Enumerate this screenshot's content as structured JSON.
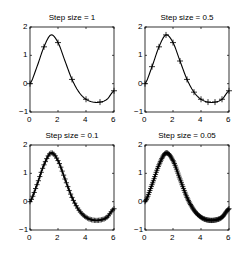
{
  "chart_data": [
    {
      "type": "line",
      "title": "Step size = 1",
      "xlabel": "",
      "ylabel": "",
      "xlim": [
        0,
        6
      ],
      "ylim": [
        -1,
        2
      ],
      "xticks": [
        "0",
        "2",
        "4",
        "6"
      ],
      "yticks": [
        "-1",
        "0",
        "1",
        "2"
      ],
      "grid": false,
      "marker": "+",
      "series": [
        {
          "name": "exact",
          "style": "line",
          "x": [
            0,
            0.5,
            1,
            1.5,
            2,
            2.5,
            3,
            3.5,
            4,
            4.5,
            5,
            5.5,
            6
          ],
          "y": [
            0,
            0.6,
            1.3,
            1.72,
            1.45,
            0.8,
            0.15,
            -0.3,
            -0.55,
            -0.65,
            -0.65,
            -0.55,
            -0.25
          ]
        },
        {
          "name": "approx",
          "style": "markers",
          "x": [
            0,
            1,
            2,
            3,
            4,
            5,
            6
          ],
          "y": [
            0,
            1.3,
            1.45,
            0.15,
            -0.55,
            -0.65,
            -0.25
          ]
        }
      ]
    },
    {
      "type": "line",
      "title": "Step size = 0.5",
      "xlim": [
        0,
        6
      ],
      "ylim": [
        -1,
        2
      ],
      "xticks": [
        "0",
        "2",
        "4",
        "6"
      ],
      "yticks": [
        "-1",
        "0",
        "1",
        "2"
      ],
      "marker": "+",
      "series": [
        {
          "name": "approx",
          "step": 0.5,
          "x": [
            0,
            0.5,
            1,
            1.5,
            2,
            2.5,
            3,
            3.5,
            4,
            4.5,
            5,
            5.5,
            6
          ],
          "y": [
            0,
            0.6,
            1.3,
            1.72,
            1.45,
            0.8,
            0.15,
            -0.3,
            -0.55,
            -0.65,
            -0.65,
            -0.55,
            -0.25
          ]
        }
      ]
    },
    {
      "type": "line",
      "title": "Step size = 0.1",
      "xlim": [
        0,
        6
      ],
      "ylim": [
        -1,
        2
      ],
      "xticks": [
        "0",
        "2",
        "4",
        "6"
      ],
      "yticks": [
        "-1",
        "0",
        "1",
        "2"
      ],
      "marker": "+",
      "series": [
        {
          "name": "approx",
          "step": 0.1
        }
      ]
    },
    {
      "type": "line",
      "title": "Step size = 0.05",
      "xlim": [
        0,
        6
      ],
      "ylim": [
        -1,
        2
      ],
      "xticks": [
        "0",
        "2",
        "4",
        "6"
      ],
      "yticks": [
        "-1",
        "0",
        "1",
        "2"
      ],
      "marker": "+",
      "series": [
        {
          "name": "approx",
          "step": 0.05
        }
      ]
    }
  ],
  "panels": [
    {
      "title": "Step size = 1"
    },
    {
      "title": "Step size = 0.5"
    },
    {
      "title": "Step size = 0.1"
    },
    {
      "title": "Step size = 0.05"
    }
  ],
  "curve": {
    "x": [
      0,
      0.5,
      1,
      1.5,
      2,
      2.5,
      3,
      3.5,
      4,
      4.5,
      5,
      5.5,
      6
    ],
    "y": [
      0,
      0.6,
      1.3,
      1.72,
      1.45,
      0.8,
      0.15,
      -0.3,
      -0.55,
      -0.65,
      -0.65,
      -0.55,
      -0.25
    ]
  },
  "steps": [
    1,
    0.5,
    0.1,
    0.05
  ]
}
